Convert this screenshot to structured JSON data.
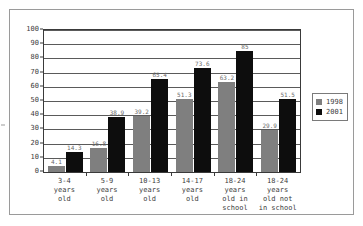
{
  "chart_data": {
    "type": "bar",
    "title": "",
    "subtitle": "",
    "xlabel": "",
    "ylabel": "",
    "ylim": [
      0,
      100
    ],
    "yticks": [
      0,
      10,
      20,
      30,
      40,
      50,
      60,
      70,
      80,
      90,
      100
    ],
    "grid": true,
    "legend_position": "right",
    "categories": [
      "3-4 years old",
      "5-9 years old",
      "10-13 years old",
      "14-17 years old",
      "18-24 years old in school",
      "18-24 years old not in school"
    ],
    "category_lines": [
      [
        "3-4",
        "years",
        "old"
      ],
      [
        "5-9",
        "years",
        "old"
      ],
      [
        "10-13",
        "years",
        "old"
      ],
      [
        "14-17",
        "years",
        "old"
      ],
      [
        "18-24",
        "years",
        "old in",
        "school"
      ],
      [
        "18-24",
        "years",
        "old not",
        "in school"
      ]
    ],
    "series": [
      {
        "name": "1998",
        "color": "#7f7f7f",
        "values": [
          4.1,
          16.8,
          39.2,
          51.3,
          63.2,
          29.9
        ],
        "labels": [
          "4.1",
          "16.8",
          "39.2",
          "51.3",
          "63.2",
          "29.9"
        ]
      },
      {
        "name": "2001",
        "color": "#0d0d0d",
        "values": [
          14.3,
          38.9,
          65.4,
          73.6,
          85,
          51.5
        ],
        "labels": [
          "14.3",
          "38.9",
          "65.4",
          "73.6",
          "85",
          "51.5"
        ]
      }
    ]
  },
  "legend": {
    "entries": [
      {
        "label": "1998",
        "color": "#7f7f7f"
      },
      {
        "label": "2001",
        "color": "#0d0d0d"
      }
    ]
  }
}
